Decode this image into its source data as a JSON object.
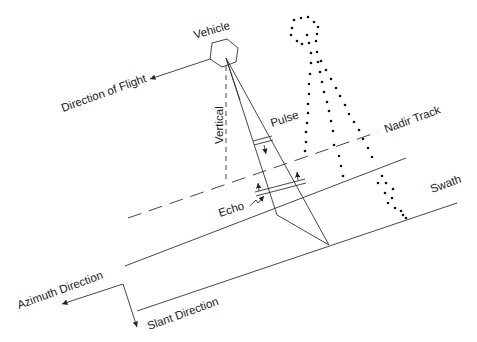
{
  "diagram": {
    "type": "side-looking radar / SAR imaging geometry",
    "labels": {
      "vehicle": "Vehicle",
      "direction_of_flight": "Direction of Flight",
      "vertical": "Vertical",
      "pulse": "Pulse",
      "nadir_track": "Nadir Track",
      "echo": "Echo",
      "swath": "Swath",
      "azimuth_direction": "Azimuth Direction",
      "slant_direction": "Slant Direction"
    },
    "colors": {
      "line": "#333333",
      "text": "#222222",
      "background": "#ffffff"
    }
  }
}
